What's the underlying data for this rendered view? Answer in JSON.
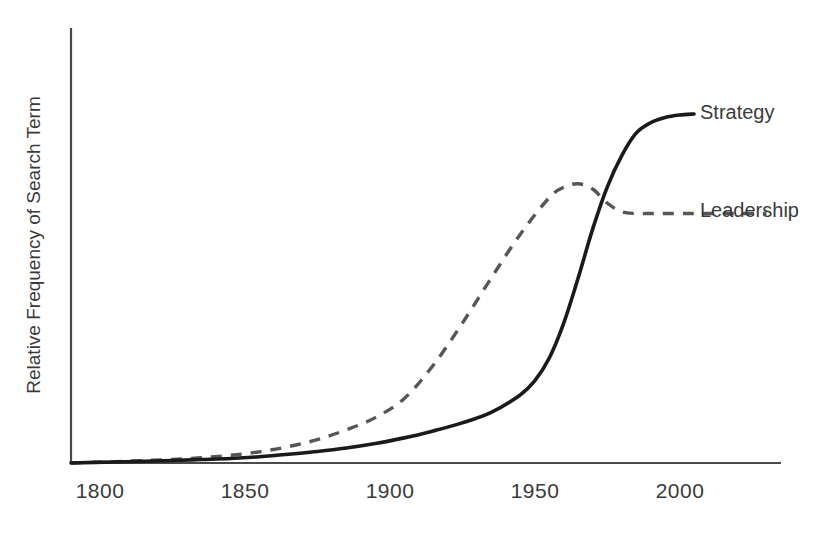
{
  "chart_data": {
    "type": "line",
    "title": "",
    "xlabel": "",
    "ylabel": "Relative Frequency of Search Term",
    "xlim": [
      1785,
      2030
    ],
    "ylim": [
      0,
      1.12
    ],
    "grid": false,
    "legend_position": "right-of-curve-end",
    "xticks": [
      1800,
      1850,
      1900,
      1950,
      2000
    ],
    "xtick_labels": [
      "1800",
      "1850",
      "1900",
      "1950",
      "2000"
    ],
    "yticks": [],
    "ytick_labels": [],
    "axis_color": "#4a4a4a",
    "series": [
      {
        "name": "Strategy",
        "style": "solid",
        "color": "#1a1a1a",
        "label_position": {
          "x": 2001,
          "y": 1.0
        },
        "x": [
          1785,
          1800,
          1810,
          1820,
          1830,
          1840,
          1850,
          1860,
          1870,
          1880,
          1890,
          1900,
          1910,
          1920,
          1930,
          1940,
          1945,
          1950,
          1955,
          1960,
          1965,
          1970,
          1975,
          1980,
          1985,
          1990,
          1995,
          2000
        ],
        "values": [
          0.0,
          0.003,
          0.005,
          0.007,
          0.01,
          0.013,
          0.018,
          0.025,
          0.033,
          0.043,
          0.056,
          0.072,
          0.092,
          0.115,
          0.145,
          0.195,
          0.235,
          0.3,
          0.4,
          0.53,
          0.67,
          0.79,
          0.88,
          0.945,
          0.975,
          0.99,
          0.997,
          1.0
        ]
      },
      {
        "name": "Leadership",
        "style": "dashed",
        "color": "#565656",
        "label_position": {
          "x": 2001,
          "y": 0.72
        },
        "x": [
          1785,
          1800,
          1810,
          1820,
          1830,
          1840,
          1850,
          1860,
          1870,
          1880,
          1890,
          1900,
          1910,
          1920,
          1930,
          1940,
          1950,
          1955,
          1960,
          1965,
          1970,
          1975,
          1980,
          1985,
          1990,
          1995,
          2000,
          2010,
          2025
        ],
        "values": [
          0.0,
          0.004,
          0.007,
          0.01,
          0.015,
          0.022,
          0.032,
          0.047,
          0.067,
          0.095,
          0.13,
          0.185,
          0.28,
          0.4,
          0.53,
          0.655,
          0.76,
          0.79,
          0.8,
          0.785,
          0.745,
          0.72,
          0.715,
          0.715,
          0.715,
          0.715,
          0.715,
          0.715,
          0.715
        ]
      }
    ]
  },
  "legend": {
    "strategy_label": "Strategy",
    "leadership_label": "Leadership"
  },
  "axes": {
    "y_title": "Relative Frequency of Search Term",
    "x_tick_1": "1800",
    "x_tick_2": "1850",
    "x_tick_3": "1900",
    "x_tick_4": "1950",
    "x_tick_5": "2000"
  }
}
